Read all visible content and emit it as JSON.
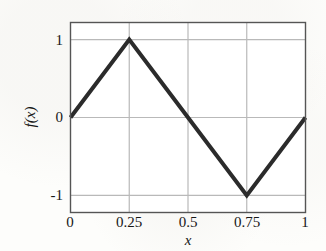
{
  "chart_data": {
    "type": "line",
    "title": "",
    "subtitle": "",
    "xlabel": "x",
    "ylabel": "f(x)",
    "xlim": [
      0,
      1
    ],
    "ylim": [
      -1.22,
      1.22
    ],
    "xticks": [
      0,
      0.25,
      0.5,
      0.75,
      1
    ],
    "xticklabels": [
      "0",
      "0.25",
      "0.5",
      "0.75",
      "1"
    ],
    "yticks": [
      -1,
      0,
      1
    ],
    "yticklabels": [
      "-1",
      "0",
      "1"
    ],
    "grid": true,
    "legend": false,
    "legend_position": "none",
    "annotations": [],
    "series": [
      {
        "name": "triangle wave",
        "color": "#2b2b2b",
        "linewidth": 4,
        "x": [
          0,
          0.25,
          0.5,
          0.75,
          1
        ],
        "values": [
          0,
          1,
          0,
          -1,
          0
        ]
      }
    ]
  },
  "style": {
    "background": "#fdfdfb",
    "frame_color": "#555555",
    "grid_color": "#b9b9b9",
    "line_color": "#2b2b2b",
    "text_color": "#171717"
  }
}
